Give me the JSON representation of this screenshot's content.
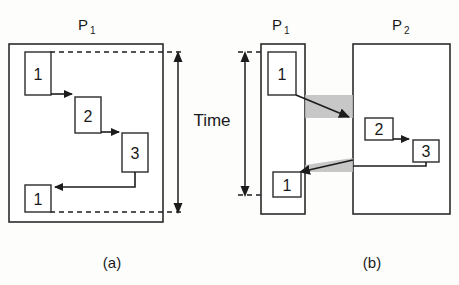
{
  "figure": {
    "time_label": "Time",
    "panels": [
      {
        "id": "a",
        "caption": "(a)",
        "processes": [
          {
            "name": "P",
            "subscript": "1"
          }
        ],
        "steps": [
          {
            "label": "1",
            "process": "P1"
          },
          {
            "label": "2",
            "process": "P1"
          },
          {
            "label": "3",
            "process": "P1"
          },
          {
            "label": "1",
            "process": "P1"
          }
        ]
      },
      {
        "id": "b",
        "caption": "(b)",
        "processes": [
          {
            "name": "P",
            "subscript": "1"
          },
          {
            "name": "P",
            "subscript": "2"
          }
        ],
        "steps": [
          {
            "label": "1",
            "process": "P1"
          },
          {
            "label": "2",
            "process": "P2"
          },
          {
            "label": "3",
            "process": "P2"
          },
          {
            "label": "1",
            "process": "P1"
          }
        ]
      }
    ],
    "colors": {
      "stroke": "#2b2b2b",
      "message_band": "#bdbdbd",
      "background": "#fdfdfc"
    }
  }
}
